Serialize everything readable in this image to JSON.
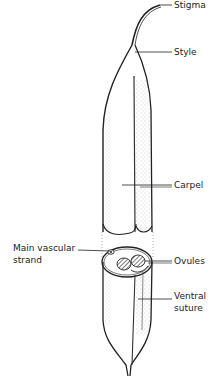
{
  "diagram": {
    "labels": {
      "stigma": "Stigma",
      "style": "Style",
      "carpel": "Carpel",
      "main_vascular_strand_line1": "Main vascular",
      "main_vascular_strand_line2": "strand",
      "ovules": "Ovules",
      "ventral_suture_line1": "Ventral",
      "ventral_suture_line2": "suture"
    },
    "colors": {
      "ink": "#222222",
      "stipple": "#9a9a9a",
      "background": "#ffffff"
    }
  }
}
